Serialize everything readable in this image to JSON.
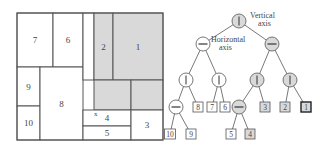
{
  "colors": {
    "line": "#555555",
    "shade": "#d9d9d9",
    "background": "#ffffff",
    "text": "#444444"
  },
  "partition": {
    "outer": {
      "x": 17,
      "y": 13,
      "w": 146,
      "h": 127
    },
    "regions": [
      {
        "label": "7",
        "x": 17,
        "y": 13,
        "w": 36,
        "h": 54,
        "shaded": false
      },
      {
        "label": "6",
        "x": 53,
        "y": 13,
        "w": 30,
        "h": 54,
        "shaded": false
      },
      {
        "label": "9",
        "x": 17,
        "y": 67,
        "w": 23,
        "h": 39,
        "shaded": false
      },
      {
        "label": "10",
        "x": 17,
        "y": 106,
        "w": 23,
        "h": 34,
        "shaded": false
      },
      {
        "label": "8",
        "x": 40,
        "y": 67,
        "w": 43,
        "h": 73,
        "shaded": false
      },
      {
        "label": "",
        "x": 83,
        "y": 13,
        "w": 11,
        "h": 67,
        "shaded": false
      },
      {
        "label": "2",
        "x": 94,
        "y": 13,
        "w": 19,
        "h": 67,
        "shaded": true
      },
      {
        "label": "1",
        "x": 113,
        "y": 13,
        "w": 50,
        "h": 67,
        "shaded": true
      },
      {
        "label": "",
        "x": 94,
        "y": 80,
        "w": 37,
        "h": 30,
        "shaded": true
      },
      {
        "label": "",
        "x": 131,
        "y": 80,
        "w": 32,
        "h": 30,
        "shaded": true
      },
      {
        "label": "4",
        "x": 83,
        "y": 110,
        "w": 48,
        "h": 16,
        "shaded": false
      },
      {
        "label": "5",
        "x": 83,
        "y": 126,
        "w": 48,
        "h": 14,
        "shaded": false
      },
      {
        "label": "3",
        "x": 131,
        "y": 110,
        "w": 32,
        "h": 30,
        "shaded": false
      }
    ],
    "point_label": "x"
  },
  "tree": {
    "annotations": [
      {
        "text": "Vertical",
        "x": 250,
        "y": 18
      },
      {
        "text": "axis",
        "x": 258,
        "y": 26
      },
      {
        "text": "Horizontal",
        "x": 211,
        "y": 42
      },
      {
        "text": "axis",
        "x": 219,
        "y": 50
      }
    ],
    "nodes": [
      {
        "id": "root",
        "type": "split",
        "axis": "vertical",
        "x": 239,
        "y": 21,
        "shaded": true
      },
      {
        "id": "hl",
        "type": "split",
        "axis": "horizontal",
        "x": 203,
        "y": 44,
        "shaded": false
      },
      {
        "id": "hr",
        "type": "split",
        "axis": "horizontal",
        "x": 272,
        "y": 44,
        "shaded": true
      },
      {
        "id": "v1",
        "type": "split",
        "axis": "vertical",
        "x": 186,
        "y": 80,
        "shaded": false
      },
      {
        "id": "v2",
        "type": "split",
        "axis": "vertical",
        "x": 219,
        "y": 80,
        "shaded": false
      },
      {
        "id": "v3",
        "type": "split",
        "axis": "vertical",
        "x": 257,
        "y": 80,
        "shaded": true
      },
      {
        "id": "v4",
        "type": "split",
        "axis": "vertical",
        "x": 290,
        "y": 80,
        "shaded": true
      },
      {
        "id": "h1",
        "type": "split",
        "axis": "horizontal",
        "x": 176,
        "y": 107,
        "shaded": false
      },
      {
        "id": "l8",
        "type": "leaf",
        "label": "8",
        "x": 198,
        "y": 107,
        "shaded": false
      },
      {
        "id": "l7",
        "type": "leaf",
        "label": "7",
        "x": 212,
        "y": 107,
        "shaded": false
      },
      {
        "id": "l6",
        "type": "leaf",
        "label": "6",
        "x": 225,
        "y": 107,
        "shaded": false
      },
      {
        "id": "h2",
        "type": "split",
        "axis": "horizontal",
        "x": 239,
        "y": 107,
        "shaded": true
      },
      {
        "id": "l3",
        "type": "leaf",
        "label": "3",
        "x": 265,
        "y": 107,
        "shaded": true
      },
      {
        "id": "l2",
        "type": "leaf",
        "label": "2",
        "x": 285,
        "y": 107,
        "shaded": true
      },
      {
        "id": "l1",
        "type": "leaf",
        "label": "1",
        "x": 306,
        "y": 107,
        "shaded": true,
        "bold": true
      },
      {
        "id": "l10",
        "type": "leaf",
        "label": "10",
        "x": 170,
        "y": 134,
        "shaded": false
      },
      {
        "id": "l9",
        "type": "leaf",
        "label": "9",
        "x": 191,
        "y": 134,
        "shaded": false
      },
      {
        "id": "l5",
        "type": "leaf",
        "label": "5",
        "x": 231,
        "y": 134,
        "shaded": false
      },
      {
        "id": "l4",
        "type": "leaf",
        "label": "4",
        "x": 250,
        "y": 134,
        "shaded": true
      }
    ],
    "edges": [
      [
        "root",
        "hl"
      ],
      [
        "root",
        "hr"
      ],
      [
        "hl",
        "v1"
      ],
      [
        "hl",
        "v2"
      ],
      [
        "hr",
        "v3"
      ],
      [
        "hr",
        "v4"
      ],
      [
        "v1",
        "h1"
      ],
      [
        "v1",
        "l8"
      ],
      [
        "v2",
        "l7"
      ],
      [
        "v2",
        "l6"
      ],
      [
        "v3",
        "h2"
      ],
      [
        "v3",
        "l3"
      ],
      [
        "v4",
        "l2"
      ],
      [
        "v4",
        "l1"
      ],
      [
        "h1",
        "l10"
      ],
      [
        "h1",
        "l9"
      ],
      [
        "h2",
        "l5"
      ],
      [
        "h2",
        "l4"
      ]
    ]
  }
}
